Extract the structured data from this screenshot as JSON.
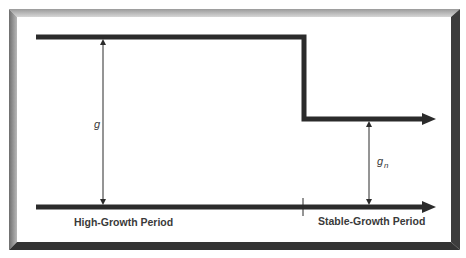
{
  "diagram": {
    "type": "growth-period-step",
    "labels": {
      "high_growth_period": "High-Growth Period",
      "stable_growth_period": "Stable-Growth Period"
    },
    "variables": {
      "high_growth_rate": "g",
      "stable_growth_rate_base": "g",
      "stable_growth_rate_subscript": "n"
    },
    "colors": {
      "line": "#2b2b2b",
      "frame_light": "#c8c8c8",
      "frame_mid": "#8a8a8a",
      "frame_dark": "#3a3a3a",
      "background": "#ffffff",
      "text": "#3a3a3a"
    }
  }
}
